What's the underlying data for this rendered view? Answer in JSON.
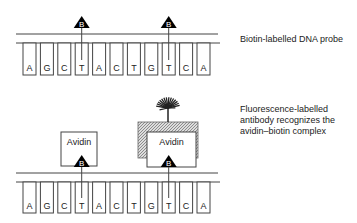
{
  "panels": [
    {
      "id": "probe",
      "sequence": [
        "A",
        "G",
        "C",
        "T",
        "A",
        "C",
        "T",
        "G",
        "T",
        "C",
        "A"
      ],
      "biotin_positions": [
        3,
        8
      ],
      "biotin_label": "B",
      "caption": "Biotin-labelled DNA probe"
    },
    {
      "id": "detection",
      "sequence": [
        "A",
        "G",
        "C",
        "T",
        "A",
        "C",
        "T",
        "G",
        "T",
        "C",
        "A"
      ],
      "biotin_positions": [
        3,
        8
      ],
      "biotin_label": "B",
      "avidin_label": "Avidin",
      "caption_lines": [
        "Fluorescence-labelled",
        "antibody recognizes the",
        "avidin–biotin complex"
      ]
    }
  ],
  "colors": {
    "line": "#444444",
    "fill_dark": "#000000",
    "hatch": "#888888"
  }
}
